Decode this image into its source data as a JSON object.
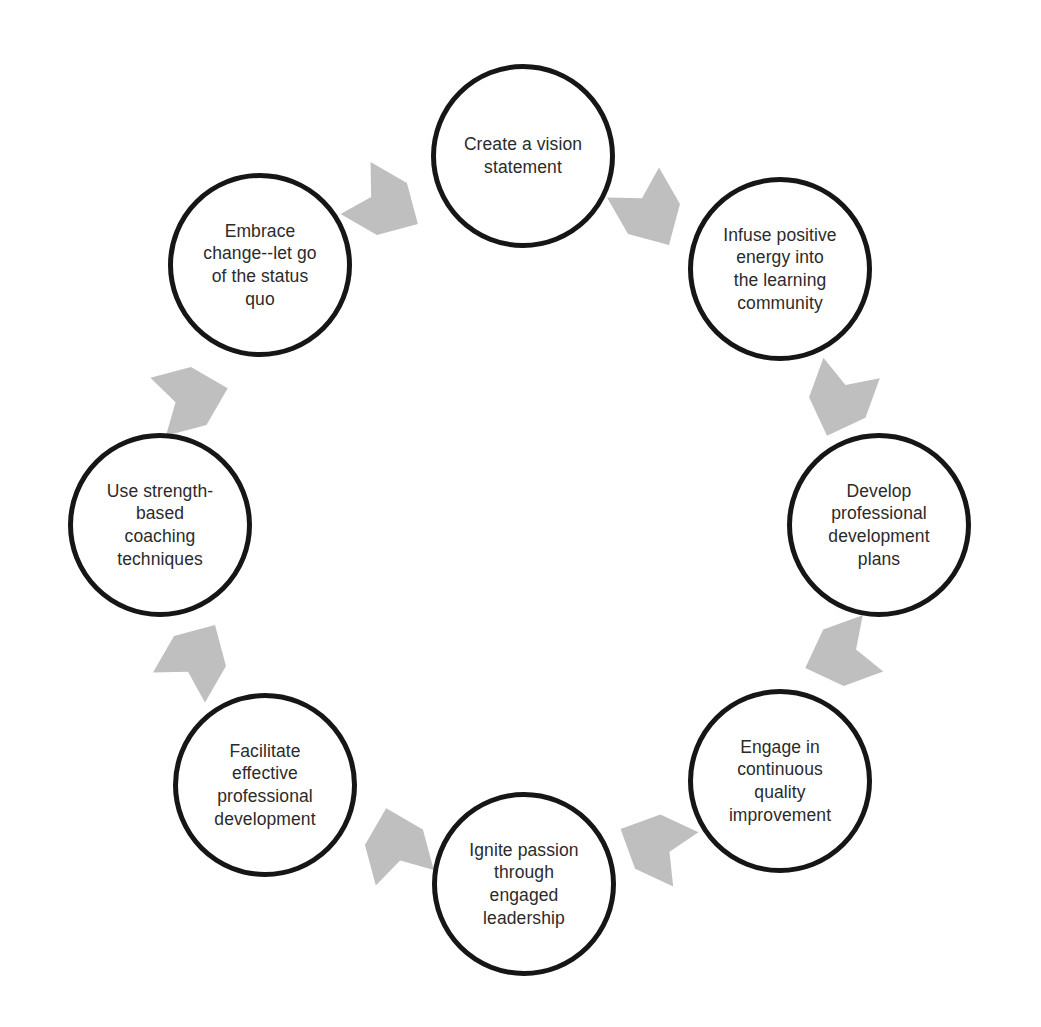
{
  "diagram": {
    "type": "cycle",
    "direction": "clockwise",
    "node_count": 8,
    "arrow_count": 8,
    "colors": {
      "background": "#ffffff",
      "node_border": "#161616",
      "node_fill": "#ffffff",
      "node_text": "#2b2b2b",
      "arrow_fill": "#bfbfbf"
    },
    "nodes": [
      {
        "index": 1,
        "position": "top",
        "label": "Create a vision\nstatement",
        "cx": 523,
        "cy": 156,
        "r": 92
      },
      {
        "index": 2,
        "position": "top-right",
        "label": "Infuse positive\nenergy into\nthe learning\ncommunity",
        "cx": 780,
        "cy": 269,
        "r": 92
      },
      {
        "index": 3,
        "position": "right",
        "label": "Develop\nprofessional\ndevelopment\nplans",
        "cx": 879,
        "cy": 525,
        "r": 92
      },
      {
        "index": 4,
        "position": "bottom-right",
        "label": "Engage in\ncontinuous\nquality\nimprovement",
        "cx": 780,
        "cy": 781,
        "r": 92
      },
      {
        "index": 5,
        "position": "bottom",
        "label": "Ignite passion\nthrough\nengaged\nleadership",
        "cx": 524,
        "cy": 884,
        "r": 92
      },
      {
        "index": 6,
        "position": "bottom-left",
        "label": "Facilitate\neffective\nprofessional\ndevelopment",
        "cx": 265,
        "cy": 785,
        "r": 92
      },
      {
        "index": 7,
        "position": "left",
        "label": "Use strength-\nbased\ncoaching\ntechniques",
        "cx": 160,
        "cy": 525,
        "r": 92
      },
      {
        "index": 8,
        "position": "top-left",
        "label": "Embrace\nchange--let go\nof the status\nquo",
        "cx": 260,
        "cy": 265,
        "r": 92
      }
    ],
    "arrows": [
      {
        "index": 1,
        "from": 1,
        "to": 2,
        "cx": 650,
        "cy": 212,
        "rotation": 60,
        "name": "arrow-vision-to-infuse"
      },
      {
        "index": 2,
        "from": 2,
        "to": 3,
        "cx": 840,
        "cy": 400,
        "rotation": 110,
        "name": "arrow-infuse-to-develop"
      },
      {
        "index": 3,
        "from": 3,
        "to": 4,
        "cx": 841,
        "cy": 655,
        "rotation": 160,
        "name": "arrow-develop-to-engage"
      },
      {
        "index": 4,
        "from": 4,
        "to": 5,
        "cx": 655,
        "cy": 845,
        "rotation": 205,
        "name": "arrow-engage-to-ignite"
      },
      {
        "index": 5,
        "from": 5,
        "to": 6,
        "cx": 396,
        "cy": 845,
        "rotation": 255,
        "name": "arrow-ignite-to-facilitate"
      },
      {
        "index": 6,
        "from": 6,
        "to": 7,
        "cx": 196,
        "cy": 658,
        "rotation": 300,
        "name": "arrow-facilitate-to-coaching"
      },
      {
        "index": 7,
        "from": 7,
        "to": 8,
        "cx": 191,
        "cy": 398,
        "rotation": 345,
        "name": "arrow-coaching-to-embrace"
      },
      {
        "index": 8,
        "from": 8,
        "to": 1,
        "cx": 385,
        "cy": 205,
        "rotation": 30,
        "name": "arrow-embrace-to-vision"
      }
    ]
  }
}
